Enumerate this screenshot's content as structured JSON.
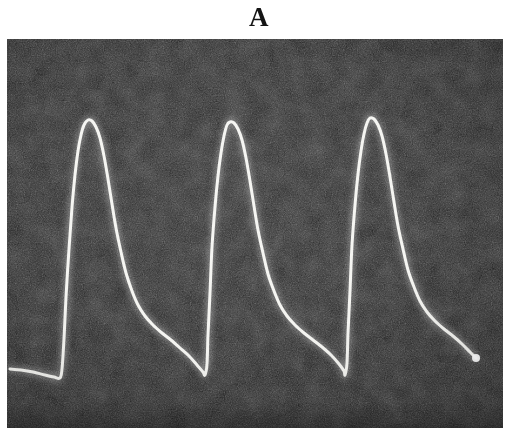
{
  "figure": {
    "panel_letter": "A",
    "background_color": "#ffffff",
    "panel_color": "#242424",
    "trace_color": "#f4f4f0",
    "panel_rect": {
      "x": 7,
      "y": 39,
      "width": 496,
      "height": 389
    }
  },
  "chart_data": {
    "type": "line",
    "title": "A",
    "subtitle": "",
    "xlabel": "",
    "ylabel": "",
    "grid": false,
    "legend": null,
    "axes_visible": false,
    "tick_labels": {
      "x": [],
      "y": []
    },
    "xlim": [
      0,
      496
    ],
    "ylim": [
      389,
      0
    ],
    "series": [
      {
        "name": "pulse-trace",
        "color": "#f4f4f0",
        "line_width": 3,
        "cycles": 3,
        "cycle_period_px": 142,
        "baseline_y_px": 336,
        "peak_y_px": 81,
        "amplitude_px": 255,
        "peaks": [
          {
            "index": 1,
            "apex_x": 81,
            "apex_y": 81
          },
          {
            "index": 2,
            "apex_x": 223,
            "apex_y": 83
          },
          {
            "index": 3,
            "apex_x": 363,
            "apex_y": 79
          }
        ],
        "troughs": [
          {
            "index": 0,
            "x": 53,
            "y": 339
          },
          {
            "index": 1,
            "x": 198,
            "y": 336
          },
          {
            "index": 2,
            "x": 338,
            "y": 333
          },
          {
            "index": 3,
            "x": 469,
            "y": 319
          }
        ],
        "points": [
          [
            3,
            330
          ],
          [
            14,
            331
          ],
          [
            26,
            333
          ],
          [
            38,
            336
          ],
          [
            47,
            338
          ],
          [
            53,
            339
          ],
          [
            55,
            330
          ],
          [
            57,
            300
          ],
          [
            59,
            258
          ],
          [
            62,
            210
          ],
          [
            65,
            168
          ],
          [
            68,
            136
          ],
          [
            71,
            112
          ],
          [
            74,
            96
          ],
          [
            77,
            86
          ],
          [
            81,
            81
          ],
          [
            85,
            82
          ],
          [
            89,
            88
          ],
          [
            93,
            99
          ],
          [
            97,
            117
          ],
          [
            101,
            140
          ],
          [
            105,
            165
          ],
          [
            109,
            189
          ],
          [
            114,
            213
          ],
          [
            119,
            234
          ],
          [
            125,
            252
          ],
          [
            131,
            266
          ],
          [
            138,
            277
          ],
          [
            146,
            286
          ],
          [
            155,
            294
          ],
          [
            164,
            301
          ],
          [
            173,
            309
          ],
          [
            182,
            317
          ],
          [
            190,
            326
          ],
          [
            196,
            333
          ],
          [
            198,
            336
          ],
          [
            200,
            325
          ],
          [
            201,
            296
          ],
          [
            203,
            254
          ],
          [
            205,
            208
          ],
          [
            208,
            168
          ],
          [
            211,
            137
          ],
          [
            214,
            114
          ],
          [
            217,
            97
          ],
          [
            220,
            86
          ],
          [
            223,
            83
          ],
          [
            227,
            84
          ],
          [
            231,
            90
          ],
          [
            235,
            101
          ],
          [
            239,
            119
          ],
          [
            243,
            142
          ],
          [
            247,
            167
          ],
          [
            251,
            191
          ],
          [
            256,
            214
          ],
          [
            261,
            235
          ],
          [
            267,
            252
          ],
          [
            273,
            266
          ],
          [
            280,
            277
          ],
          [
            288,
            286
          ],
          [
            297,
            294
          ],
          [
            306,
            301
          ],
          [
            315,
            308
          ],
          [
            324,
            316
          ],
          [
            332,
            325
          ],
          [
            337,
            332
          ],
          [
            338,
            336
          ],
          [
            340,
            324
          ],
          [
            341,
            294
          ],
          [
            343,
            252
          ],
          [
            345,
            206
          ],
          [
            348,
            166
          ],
          [
            351,
            135
          ],
          [
            354,
            112
          ],
          [
            357,
            95
          ],
          [
            360,
            84
          ],
          [
            363,
            79
          ],
          [
            367,
            80
          ],
          [
            371,
            86
          ],
          [
            375,
            97
          ],
          [
            379,
            115
          ],
          [
            383,
            138
          ],
          [
            387,
            163
          ],
          [
            391,
            187
          ],
          [
            396,
            210
          ],
          [
            401,
            231
          ],
          [
            407,
            248
          ],
          [
            413,
            262
          ],
          [
            420,
            273
          ],
          [
            428,
            282
          ],
          [
            437,
            290
          ],
          [
            446,
            297
          ],
          [
            455,
            305
          ],
          [
            463,
            313
          ],
          [
            469,
            319
          ]
        ],
        "terminal_marker": {
          "x": 469,
          "y": 319,
          "radius": 4
        }
      }
    ]
  }
}
